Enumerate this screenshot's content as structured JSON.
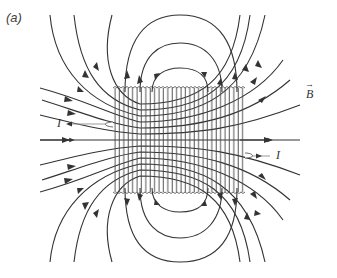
{
  "figure": {
    "panel_label": "(a)",
    "field_label": "B",
    "field_vector_arrow": "→",
    "current_label_left": "I",
    "current_label_right": "I",
    "colors": {
      "field_line": "#333333",
      "coil": "#444444",
      "background": "#ffffff",
      "current_lead": "#999999"
    }
  }
}
